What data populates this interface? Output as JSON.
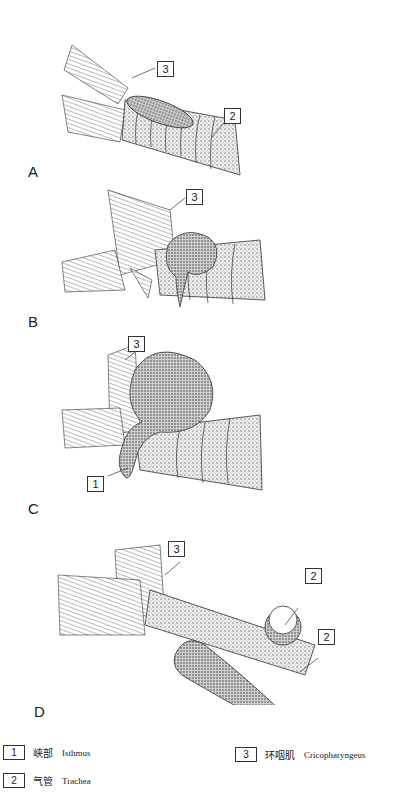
{
  "figure": {
    "panels": [
      {
        "letter": "A",
        "callouts": [
          "3",
          "2"
        ]
      },
      {
        "letter": "B",
        "callouts": [
          "3"
        ]
      },
      {
        "letter": "C",
        "callouts": [
          "3",
          "1"
        ]
      },
      {
        "letter": "D",
        "callouts": [
          "3",
          "2",
          "2"
        ]
      }
    ]
  },
  "legend": {
    "items": [
      {
        "number": "1",
        "chinese": "峡部",
        "english": "Isthmus"
      },
      {
        "number": "2",
        "chinese": "气管",
        "english": "Trachea"
      },
      {
        "number": "3",
        "chinese": "环咽肌",
        "english": "Cricopharyngeus"
      }
    ]
  },
  "colors": {
    "ink": "#222222",
    "background": "#ffffff",
    "shade": "#9a9a9a"
  }
}
